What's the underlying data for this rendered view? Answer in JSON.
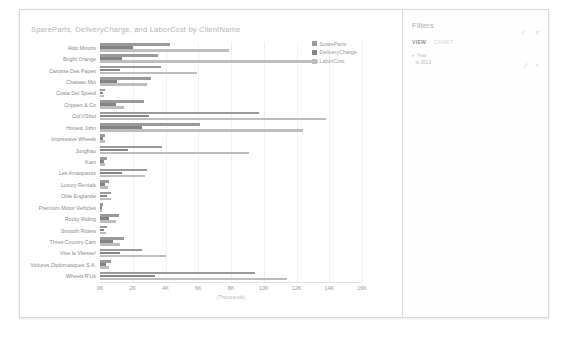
{
  "report": {
    "chart_title": "SpareParts, DeliveryCharge, and LaborCost by ClientName"
  },
  "filters": {
    "header": "Filters",
    "collapse_icon": "chevron-left-icon",
    "close_icon": "close-icon",
    "tabs": [
      {
        "label": "VIEW",
        "active": true
      },
      {
        "label": "CHART",
        "active": false
      }
    ],
    "items": [
      {
        "expander": "▸",
        "field": "Year",
        "value": "is 2013",
        "edit_icon": "pencil-icon",
        "clear_icon": "clear-icon"
      }
    ]
  },
  "chart_data": {
    "type": "bar",
    "orientation": "horizontal",
    "grouped": true,
    "title": "SpareParts, DeliveryCharge, and LaborCost by ClientName",
    "xlabel": "(Thousands)",
    "ylabel": "",
    "xlim": [
      0,
      16000
    ],
    "xticks": [
      0,
      2000,
      4000,
      6000,
      8000,
      10000,
      12000,
      14000,
      16000
    ],
    "xticklabels": [
      "0K",
      "2K",
      "4K",
      "6K",
      "8K",
      "10K",
      "12K",
      "14K",
      "16K"
    ],
    "grid": true,
    "legend_position": "right",
    "categories": [
      "Aldo Motors",
      "Bright Orange",
      "Carosse Des Papes",
      "Chateau Moi",
      "Costa Del Speed",
      "Crippen & Co",
      "Cut'n'Shut",
      "Honest John",
      "Impressive Wheels",
      "Jungfrau",
      "Kant",
      "Les Arnaqueurs",
      "Luxury Rentals",
      "Olde Englande",
      "Premium Motor Vehicles",
      "Rocky Riding",
      "Smooth Riders",
      "Three Country Cars",
      "Vive la Vitesse!",
      "Voitures Diplomatiques S.A.",
      "Wheels'R'Us"
    ],
    "series": [
      {
        "name": "SpareParts",
        "color": "#9a9a9a",
        "values": [
          4250,
          3550,
          3700,
          3100,
          330,
          2700,
          9700,
          6100,
          330,
          3800,
          440,
          2900,
          580,
          700,
          180,
          1150,
          420,
          1450,
          2550,
          700,
          9450
        ]
      },
      {
        "name": "DeliveryCharge",
        "color": "#848484",
        "values": [
          2000,
          1350,
          1250,
          1050,
          180,
          1000,
          3000,
          2550,
          170,
          1700,
          230,
          1350,
          330,
          420,
          110,
          550,
          230,
          800,
          1250,
          380,
          3350
        ]
      },
      {
        "name": "LaborCost",
        "color": "#bdbdbd",
        "values": [
          7900,
          13300,
          5950,
          2900,
          250,
          1450,
          13800,
          12400,
          280,
          9100,
          330,
          2750,
          470,
          680,
          120,
          950,
          360,
          1250,
          4000,
          560,
          11400
        ]
      }
    ]
  }
}
